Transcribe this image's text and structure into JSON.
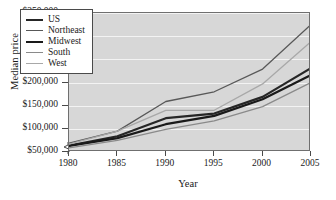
{
  "chart_data": {
    "type": "line",
    "title": "",
    "xlabel": "Year",
    "ylabel": "Median price",
    "xlim": [
      1980,
      2005
    ],
    "ylim": [
      50000,
      350000
    ],
    "grid": true,
    "legend_position": "top-left",
    "axis_break_y": true,
    "x": [
      1980,
      1985,
      1990,
      1995,
      2000,
      2005
    ],
    "xtick_labels": [
      "1980",
      "1985",
      "1990",
      "1995",
      "2000",
      "2005"
    ],
    "ytick_labels": [
      "$50,000",
      "$100,000",
      "$150,000",
      "$200,000",
      "$250,000",
      "$300,000",
      "$350,000"
    ],
    "ytick_values": [
      50000,
      100000,
      150000,
      200000,
      250000,
      300000,
      350000
    ],
    "series": [
      {
        "name": "US",
        "color": "#262626",
        "width": 2.2,
        "values": [
          64000,
          84000,
          123000,
          133000,
          169000,
          231000
        ]
      },
      {
        "name": "Northeast",
        "color": "#585858",
        "width": 1.3,
        "values": [
          69000,
          95000,
          159000,
          180000,
          229000,
          325000
        ]
      },
      {
        "name": "Midwest",
        "color": "#1a1a1a",
        "width": 2.2,
        "values": [
          63000,
          80000,
          110000,
          128000,
          164000,
          216000
        ]
      },
      {
        "name": "South",
        "color": "#8a8a8a",
        "width": 1.3,
        "values": [
          59000,
          75000,
          99000,
          117000,
          148000,
          200000
        ]
      },
      {
        "name": "West",
        "color": "#a8a8a8",
        "width": 1.3,
        "values": [
          67000,
          95000,
          140000,
          140000,
          197000,
          288000
        ]
      }
    ]
  }
}
